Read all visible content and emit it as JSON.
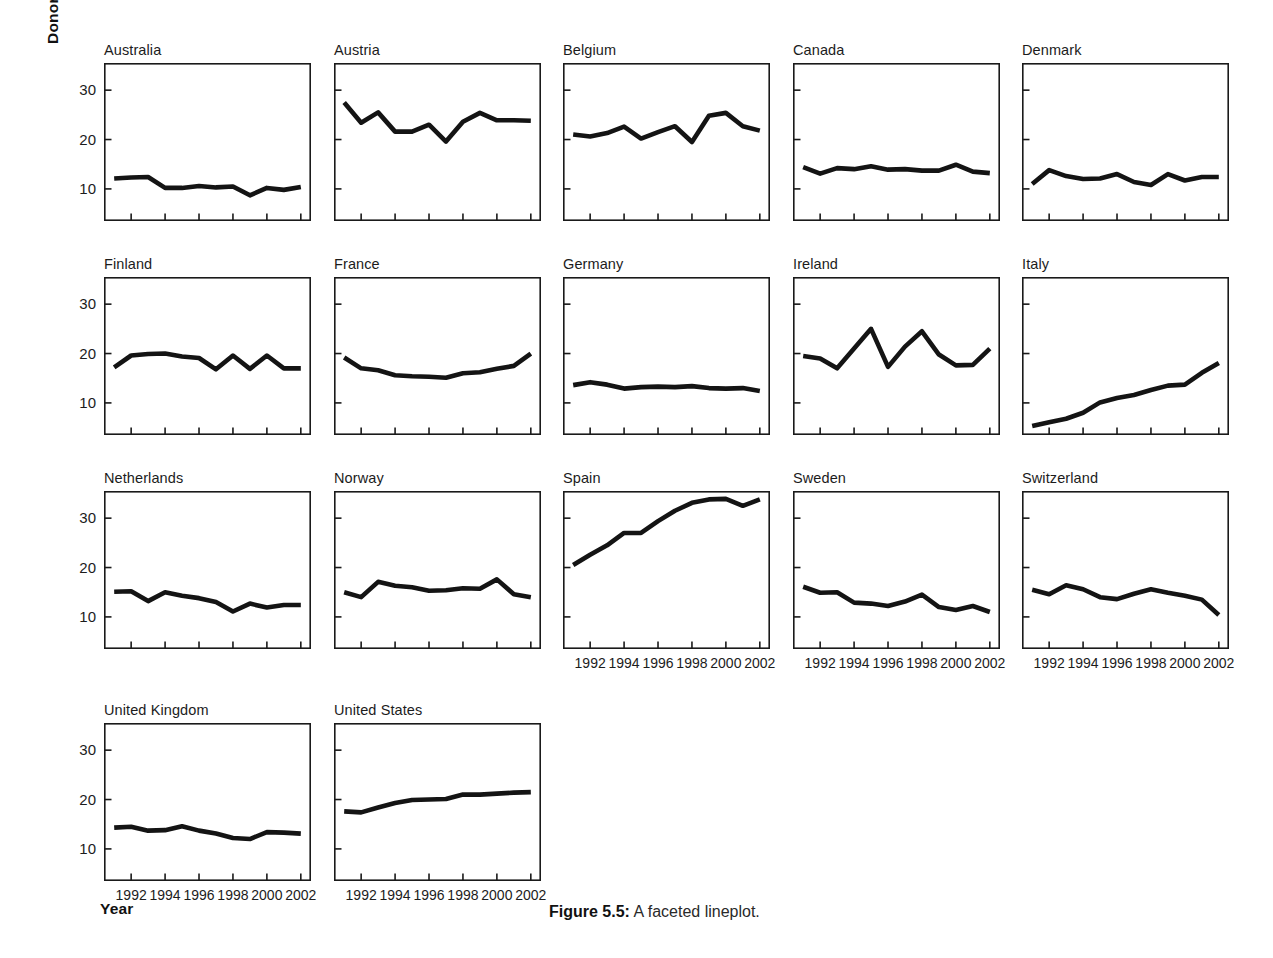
{
  "figure": {
    "caption_label": "Figure 5.5:",
    "caption_text": " A faceted lineplot.",
    "y_axis_label": "Donors",
    "x_axis_label": "Year"
  },
  "chart_data": {
    "type": "line",
    "title": "",
    "subtitle": "",
    "xlabel": "Year",
    "ylabel": "Donors",
    "facet_variable": "country",
    "facet_layout": {
      "rows": 4,
      "cols": 5
    },
    "grid": false,
    "legend": null,
    "xlim": [
      1990.4,
      2002.6
    ],
    "ylim": [
      3.5,
      35.5
    ],
    "xticks": [
      1992,
      1994,
      1996,
      1998,
      2000,
      2002
    ],
    "xticklabels": [
      "1992",
      "1994",
      "1996",
      "1998",
      "2000",
      "2002"
    ],
    "yticks": [
      10,
      20,
      30
    ],
    "yticklabels": [
      "10",
      "20",
      "30"
    ],
    "x": [
      1991,
      1992,
      1993,
      1994,
      1995,
      1996,
      1997,
      1998,
      1999,
      2000,
      2001,
      2002
    ],
    "series": [
      {
        "name": "Australia",
        "values": [
          12.1,
          12.3,
          12.4,
          10.2,
          10.2,
          10.6,
          10.3,
          10.5,
          8.7,
          10.2,
          9.8,
          10.4
        ]
      },
      {
        "name": "Austria",
        "values": [
          27.5,
          23.4,
          25.5,
          21.6,
          21.6,
          23.0,
          19.6,
          23.6,
          25.4,
          23.9,
          23.9,
          23.8
        ]
      },
      {
        "name": "Belgium",
        "values": [
          21.0,
          20.6,
          21.3,
          22.6,
          20.2,
          21.5,
          22.7,
          19.5,
          24.8,
          25.4,
          22.7,
          21.8
        ]
      },
      {
        "name": "Canada",
        "values": [
          14.4,
          13.1,
          14.2,
          14.0,
          14.6,
          13.9,
          14.0,
          13.7,
          13.7,
          14.9,
          13.5,
          13.2
        ]
      },
      {
        "name": "Denmark",
        "values": [
          11.0,
          13.8,
          12.6,
          12.0,
          12.1,
          13.0,
          11.4,
          10.8,
          13.0,
          11.7,
          12.4,
          12.4
        ]
      },
      {
        "name": "Finland",
        "values": [
          17.2,
          19.6,
          19.9,
          20.0,
          19.4,
          19.1,
          16.8,
          19.6,
          16.9,
          19.6,
          17.0,
          17.0
        ]
      },
      {
        "name": "France",
        "values": [
          19.2,
          17.0,
          16.6,
          15.6,
          15.4,
          15.3,
          15.1,
          16.0,
          16.2,
          16.9,
          17.5,
          20.0
        ]
      },
      {
        "name": "Germany",
        "values": [
          13.6,
          14.2,
          13.7,
          12.9,
          13.2,
          13.3,
          13.2,
          13.4,
          13.0,
          12.9,
          13.0,
          12.4
        ]
      },
      {
        "name": "Ireland",
        "values": [
          19.5,
          19.0,
          17.0,
          21.0,
          25.0,
          17.3,
          21.4,
          24.5,
          19.8,
          17.6,
          17.7,
          21.0
        ]
      },
      {
        "name": "Italy",
        "values": [
          5.3,
          6.1,
          6.8,
          8.0,
          10.1,
          11.0,
          11.6,
          12.6,
          13.5,
          13.7,
          16.1,
          18.1
        ]
      },
      {
        "name": "Netherlands",
        "values": [
          15.1,
          15.2,
          13.2,
          15.0,
          14.3,
          13.8,
          13.0,
          11.1,
          12.7,
          11.9,
          12.4,
          12.4
        ]
      },
      {
        "name": "Norway",
        "values": [
          15.0,
          14.0,
          17.1,
          16.3,
          16.0,
          15.3,
          15.4,
          15.8,
          15.7,
          17.6,
          14.6,
          14.0
        ]
      },
      {
        "name": "Spain",
        "values": [
          20.5,
          22.6,
          24.5,
          27.0,
          27.0,
          29.4,
          31.5,
          33.1,
          33.8,
          33.9,
          32.5,
          33.8
        ]
      },
      {
        "name": "Sweden",
        "values": [
          16.1,
          14.9,
          15.0,
          12.9,
          12.7,
          12.2,
          13.1,
          14.5,
          12.0,
          11.4,
          12.2,
          11.0
        ]
      },
      {
        "name": "Switzerland",
        "values": [
          15.5,
          14.6,
          16.4,
          15.6,
          14.0,
          13.6,
          14.7,
          15.6,
          14.9,
          14.3,
          13.5,
          10.4
        ]
      },
      {
        "name": "United Kingdom",
        "values": [
          14.3,
          14.5,
          13.7,
          13.8,
          14.6,
          13.7,
          13.1,
          12.2,
          12.0,
          13.4,
          13.3,
          13.1
        ]
      },
      {
        "name": "United States",
        "values": [
          17.6,
          17.4,
          18.4,
          19.3,
          19.9,
          20.0,
          20.1,
          21.0,
          21.0,
          21.2,
          21.4,
          21.5
        ]
      }
    ]
  },
  "panels": [
    {
      "country": "Australia",
      "row": 0,
      "col": 0,
      "show_y_labels": true,
      "show_x_labels": false
    },
    {
      "country": "Austria",
      "row": 0,
      "col": 1,
      "show_y_labels": false,
      "show_x_labels": false
    },
    {
      "country": "Belgium",
      "row": 0,
      "col": 2,
      "show_y_labels": false,
      "show_x_labels": false
    },
    {
      "country": "Canada",
      "row": 0,
      "col": 3,
      "show_y_labels": false,
      "show_x_labels": false
    },
    {
      "country": "Denmark",
      "row": 0,
      "col": 4,
      "show_y_labels": false,
      "show_x_labels": false
    },
    {
      "country": "Finland",
      "row": 1,
      "col": 0,
      "show_y_labels": true,
      "show_x_labels": false
    },
    {
      "country": "France",
      "row": 1,
      "col": 1,
      "show_y_labels": false,
      "show_x_labels": false
    },
    {
      "country": "Germany",
      "row": 1,
      "col": 2,
      "show_y_labels": false,
      "show_x_labels": false
    },
    {
      "country": "Ireland",
      "row": 1,
      "col": 3,
      "show_y_labels": false,
      "show_x_labels": false
    },
    {
      "country": "Italy",
      "row": 1,
      "col": 4,
      "show_y_labels": false,
      "show_x_labels": false
    },
    {
      "country": "Netherlands",
      "row": 2,
      "col": 0,
      "show_y_labels": true,
      "show_x_labels": false
    },
    {
      "country": "Norway",
      "row": 2,
      "col": 1,
      "show_y_labels": false,
      "show_x_labels": false
    },
    {
      "country": "Spain",
      "row": 2,
      "col": 2,
      "show_y_labels": false,
      "show_x_labels": true
    },
    {
      "country": "Sweden",
      "row": 2,
      "col": 3,
      "show_y_labels": false,
      "show_x_labels": true
    },
    {
      "country": "Switzerland",
      "row": 2,
      "col": 4,
      "show_y_labels": false,
      "show_x_labels": true
    },
    {
      "country": "United Kingdom",
      "row": 3,
      "col": 0,
      "show_y_labels": true,
      "show_x_labels": true
    },
    {
      "country": "United States",
      "row": 3,
      "col": 1,
      "show_y_labels": false,
      "show_x_labels": true
    }
  ]
}
